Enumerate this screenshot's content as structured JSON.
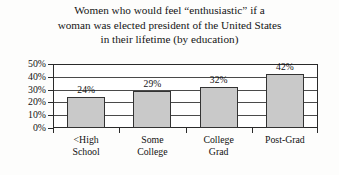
{
  "chart_data": {
    "type": "bar",
    "title": "Women who would feel “enthusiastic” if a woman was elected president of the United States in their lifetime (by education)",
    "title_lines": [
      "Women who would feel “enthusiastic” if a",
      "woman was elected president of the United States",
      "in their lifetime (by education)"
    ],
    "categories": [
      "<High School",
      "Some College",
      "College Grad",
      "Post-Grad"
    ],
    "category_label_lines": [
      [
        "<High",
        "School"
      ],
      [
        "Some",
        "College"
      ],
      [
        "College",
        "Grad"
      ],
      [
        "Post-Grad"
      ]
    ],
    "values": [
      24,
      29,
      32,
      42
    ],
    "value_labels": [
      "24%",
      "29%",
      "32%",
      "42%"
    ],
    "xlabel": "",
    "ylabel": "",
    "ylim": [
      0,
      50
    ],
    "y_tick_values": [
      50,
      40,
      30,
      20,
      10,
      0
    ],
    "y_tick_labels": [
      "50%",
      "40%",
      "30%",
      "20%",
      "10%",
      "0%"
    ],
    "grid": true,
    "grid_axis": "y",
    "legend": false,
    "legend_position": "none",
    "units": "percent",
    "bar_fill_color": "#c9c9c9",
    "bar_border_color": "#333333",
    "axis_color": "#2a2a2a",
    "text_color": "#111111",
    "background_color": "#fdfdfc"
  }
}
